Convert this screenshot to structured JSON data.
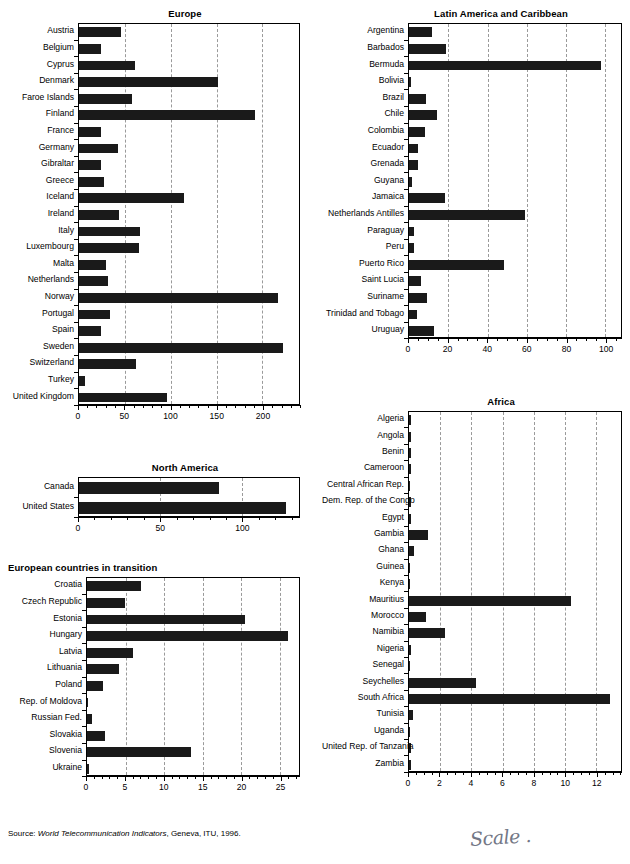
{
  "page": {
    "source_prefix": "Source: ",
    "source_italic": "World Telecommunication Indicators",
    "source_suffix": ", Geneva, ITU, 1996.",
    "annotation": "Scale ."
  },
  "chart_data": [
    {
      "id": "europe",
      "type": "bar",
      "orientation": "horizontal",
      "title": "Europe",
      "xlabel": "",
      "ylabel": "",
      "xlim": [
        0,
        240
      ],
      "ticks": [
        0,
        50,
        100,
        150,
        200
      ],
      "minor_step": 10,
      "grid": true,
      "legend": "none",
      "categories": [
        "Austria",
        "Belgium",
        "Cyprus",
        "Denmark",
        "Faroe Islands",
        "Finland",
        "France",
        "Germany",
        "Gibraltar",
        "Greece",
        "Iceland",
        "Ireland",
        "Italy",
        "Luxembourg",
        "Malta",
        "Netherlands",
        "Norway",
        "Portugal",
        "Spain",
        "Sweden",
        "Switzerland",
        "Turkey",
        "United Kingdom"
      ],
      "values": [
        46,
        24,
        61,
        152,
        58,
        192,
        24,
        42,
        24,
        27,
        114,
        44,
        66,
        65,
        29,
        32,
        217,
        34,
        24,
        223,
        62,
        7,
        96
      ]
    },
    {
      "id": "north-america",
      "type": "bar",
      "orientation": "horizontal",
      "title": "North America",
      "xlabel": "",
      "ylabel": "",
      "xlim": [
        0,
        135
      ],
      "ticks": [
        0,
        50,
        100
      ],
      "minor_step": 10,
      "grid": true,
      "legend": "none",
      "categories": [
        "Canada",
        "United States"
      ],
      "values": [
        86,
        127
      ]
    },
    {
      "id": "european-transition",
      "type": "bar",
      "orientation": "horizontal",
      "title": "European countries in transition",
      "xlabel": "",
      "ylabel": "",
      "xlim": [
        0,
        27.5
      ],
      "ticks": [
        0,
        5,
        10,
        15,
        20,
        25
      ],
      "minor_step": 1,
      "grid": true,
      "legend": "none",
      "categories": [
        "Croatia",
        "Czech Republic",
        "Estonia",
        "Hungary",
        "Latvia",
        "Lithuania",
        "Poland",
        "Rep. of Moldova",
        "Russian Fed.",
        "Slovakia",
        "Slovenia",
        "Ukraine"
      ],
      "values": [
        7.0,
        4.9,
        20.5,
        26.1,
        6.0,
        4.1,
        2.1,
        0.05,
        0.6,
        2.3,
        13.5,
        0.3
      ]
    },
    {
      "id": "latin-america",
      "type": "bar",
      "orientation": "horizontal",
      "title": "Latin America and Caribbean",
      "xlabel": "",
      "ylabel": "",
      "xlim": [
        0,
        108
      ],
      "ticks": [
        0,
        20,
        40,
        60,
        80,
        100
      ],
      "minor_step": 5,
      "grid": true,
      "legend": "none",
      "categories": [
        "Argentina",
        "Barbados",
        "Bermuda",
        "Bolivia",
        "Brazil",
        "Chile",
        "Colombia",
        "Ecuador",
        "Grenada",
        "Guyana",
        "Jamaica",
        "Netherlands Antilles",
        "Paraguay",
        "Peru",
        "Puerto Rico",
        "Saint Lucia",
        "Suriname",
        "Trinidad and Tobago",
        "Uruguay"
      ],
      "values": [
        11.5,
        19.0,
        98.0,
        1.2,
        8.5,
        14.5,
        8.0,
        4.8,
        4.6,
        1.3,
        18.5,
        59.0,
        2.8,
        2.8,
        48.5,
        6.0,
        9.2,
        4.2,
        12.5
      ]
    },
    {
      "id": "africa",
      "type": "bar",
      "orientation": "horizontal",
      "title": "Africa",
      "xlabel": "",
      "ylabel": "",
      "xlim": [
        0,
        13.6
      ],
      "ticks": [
        0,
        2,
        4,
        6,
        8,
        10,
        12
      ],
      "minor_step": 0.5,
      "grid": true,
      "legend": "none",
      "categories": [
        "Algeria",
        "Angola",
        "Benin",
        "Cameroon",
        "Central African Rep.",
        "Dem. Rep. of the Congo",
        "Egypt",
        "Gambia",
        "Ghana",
        "Guinea",
        "Kenya",
        "Mauritius",
        "Morocco",
        "Namibia",
        "Nigeria",
        "Senegal",
        "Seychelles",
        "South Africa",
        "Tunisia",
        "Uganda",
        "United Rep. of Tanzania",
        "Zambia"
      ],
      "values": [
        0.16,
        0.14,
        0.14,
        0.16,
        0.03,
        0.16,
        0.11,
        1.25,
        0.3,
        0.04,
        0.05,
        10.4,
        1.1,
        2.3,
        0.12,
        0.03,
        4.3,
        12.9,
        0.28,
        0.06,
        0.1,
        0.14
      ]
    }
  ]
}
